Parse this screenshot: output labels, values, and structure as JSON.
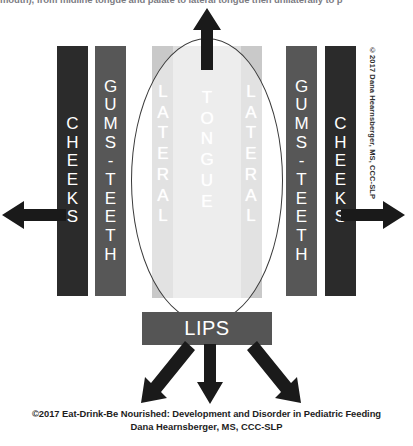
{
  "header_fragment": "mouth), from midline tongue and palate to lateral tongue then unilaterally to p",
  "diagram": {
    "left_outer_label": "CHEEKS",
    "left_inner_label": "GUMS - TEETH",
    "right_inner_label": "GUMS - TEETH",
    "right_outer_label": "CHEEKS",
    "oval_left_label": "LATERAL",
    "oval_center_label": "TONGUE",
    "oval_right_label": "LATERAL",
    "bottom_label": "LIPS",
    "arrows": {
      "up": "arrow-up",
      "left": "arrow-left",
      "right": "arrow-right",
      "down_left": "arrow-down-left",
      "down_middle": "arrow-down",
      "down_right": "arrow-down-right"
    },
    "colors": {
      "cheeks_bar": "#2b2b2b",
      "gums_bar": "#575757",
      "lips_bar": "#555555",
      "panel_outer": "#c9c9c9",
      "panel_inner": "#dedede",
      "arrow": "#1a1a1a",
      "label_text": "#ffffff"
    }
  },
  "side_copyright": "©2017 Dana Hearnsberger, MS, CCC-SLP",
  "footer": {
    "line1": "©2017 Eat-Drink-Be Nourished:  Development and Disorder in Pediatric Feeding",
    "line2": "Dana Hearnsberger, MS, CCC-SLP"
  }
}
